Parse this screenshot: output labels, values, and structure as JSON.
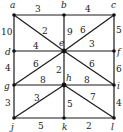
{
  "diagram": {
    "type": "weighted-graph",
    "nodes": [
      {
        "id": "a",
        "x": 14,
        "y": 15,
        "lx": 10,
        "ly": 8
      },
      {
        "id": "b",
        "x": 64,
        "y": 15,
        "lx": 61,
        "ly": 8
      },
      {
        "id": "c",
        "x": 114,
        "y": 15,
        "lx": 111,
        "ly": 8
      },
      {
        "id": "d",
        "x": 14,
        "y": 51,
        "lx": 5,
        "ly": 55
      },
      {
        "id": "e",
        "x": 64,
        "y": 51,
        "lx": 59,
        "ly": 46
      },
      {
        "id": "f",
        "x": 114,
        "y": 51,
        "lx": 117,
        "ly": 55
      },
      {
        "id": "g",
        "x": 14,
        "y": 85,
        "lx": 4,
        "ly": 89
      },
      {
        "id": "h",
        "x": 64,
        "y": 85,
        "lx": 66,
        "ly": 81
      },
      {
        "id": "i",
        "x": 114,
        "y": 85,
        "lx": 117,
        "ly": 89
      },
      {
        "id": "j",
        "x": 14,
        "y": 118,
        "lx": 11,
        "ly": 130
      },
      {
        "id": "k",
        "x": 64,
        "y": 118,
        "lx": 62,
        "ly": 130
      },
      {
        "id": "l",
        "x": 114,
        "y": 118,
        "lx": 111,
        "ly": 130
      }
    ],
    "edges": [
      {
        "from": "a",
        "to": "b",
        "weight": "3",
        "lx": 35,
        "ly": 12
      },
      {
        "from": "b",
        "to": "c",
        "weight": "4",
        "lx": 85,
        "ly": 12
      },
      {
        "from": "a",
        "to": "d",
        "weight": "10",
        "lx": 1,
        "ly": 35
      },
      {
        "from": "a",
        "to": "e",
        "weight": "2",
        "lx": 42,
        "ly": 34
      },
      {
        "from": "b",
        "to": "e",
        "weight": "9",
        "lx": 67,
        "ly": 35
      },
      {
        "from": "c",
        "to": "e",
        "weight": "6",
        "lx": 80,
        "ly": 33
      },
      {
        "from": "c",
        "to": "f",
        "weight": "5",
        "lx": 116,
        "ly": 33
      },
      {
        "from": "d",
        "to": "e",
        "weight": "4",
        "lx": 33,
        "ly": 49
      },
      {
        "from": "e",
        "to": "f",
        "weight": "3",
        "lx": 89,
        "ly": 47
      },
      {
        "from": "d",
        "to": "g",
        "weight": "4",
        "lx": 5,
        "ly": 71
      },
      {
        "from": "e",
        "to": "g",
        "weight": "6",
        "lx": 33,
        "ly": 67
      },
      {
        "from": "e",
        "to": "h",
        "weight": "2",
        "lx": 56,
        "ly": 73
      },
      {
        "from": "e",
        "to": "i",
        "weight": "6",
        "lx": 89,
        "ly": 67
      },
      {
        "from": "f",
        "to": "i",
        "weight": "6",
        "lx": 116,
        "ly": 72
      },
      {
        "from": "g",
        "to": "h",
        "weight": "8",
        "lx": 40,
        "ly": 83
      },
      {
        "from": "h",
        "to": "i",
        "weight": "8",
        "lx": 84,
        "ly": 83
      },
      {
        "from": "g",
        "to": "j",
        "weight": "3",
        "lx": 5,
        "ly": 106
      },
      {
        "from": "h",
        "to": "j",
        "weight": "3",
        "lx": 34,
        "ly": 101
      },
      {
        "from": "h",
        "to": "k",
        "weight": "5",
        "lx": 67,
        "ly": 107
      },
      {
        "from": "h",
        "to": "l",
        "weight": "7",
        "lx": 90,
        "ly": 100
      },
      {
        "from": "i",
        "to": "l",
        "weight": "4",
        "lx": 116,
        "ly": 106
      },
      {
        "from": "j",
        "to": "k",
        "weight": "5",
        "lx": 38,
        "ly": 129
      },
      {
        "from": "k",
        "to": "l",
        "weight": "2",
        "lx": 86,
        "ly": 129
      }
    ]
  }
}
